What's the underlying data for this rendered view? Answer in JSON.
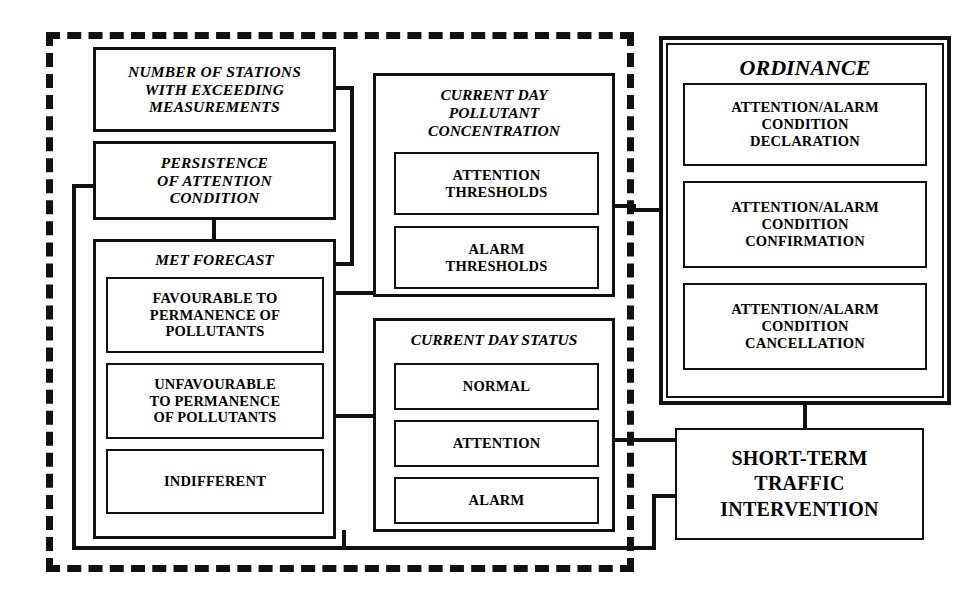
{
  "diagram": {
    "line_color": "#111111",
    "background": "#ffffff"
  },
  "dashed_region": {
    "name": "evaluation-region",
    "border_style": "dashed"
  },
  "inputs": {
    "stations": {
      "label": "NUMBER OF STATIONS\nWITH EXCEEDING\nMEASUREMENTS"
    },
    "persistence": {
      "label": "PERSISTENCE\nOF ATTENTION\nCONDITION"
    },
    "met_forecast": {
      "title": "MET FORECAST",
      "options": [
        {
          "label": "FAVOURABLE TO\nPERMANENCE OF\nPOLLUTANTS"
        },
        {
          "label": "UNFAVOURABLE\nTO PERMANENCE\nOF POLLUTANTS"
        },
        {
          "label": "INDIFFERENT"
        }
      ]
    }
  },
  "concentration": {
    "title": "CURRENT DAY\nPOLLUTANT\nCONCENTRATION",
    "items": [
      {
        "label": "ATTENTION\nTHRESHOLDS"
      },
      {
        "label": "ALARM\nTHRESHOLDS"
      }
    ]
  },
  "status": {
    "title": "CURRENT DAY STATUS",
    "items": [
      {
        "label": "NORMAL"
      },
      {
        "label": "ATTENTION"
      },
      {
        "label": "ALARM"
      }
    ]
  },
  "ordinance": {
    "title": "ORDINANCE",
    "items": [
      {
        "label": "ATTENTION/ALARM\nCONDITION\nDECLARATION"
      },
      {
        "label": "ATTENTION/ALARM\nCONDITION\nCONFIRMATION"
      },
      {
        "label": "ATTENTION/ALARM\nCONDITION\nCANCELLATION"
      }
    ]
  },
  "intervention": {
    "label": "SHORT-TERM\nTRAFFIC\nINTERVENTION"
  }
}
